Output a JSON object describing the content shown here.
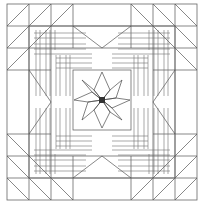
{
  "figure": {
    "kind": "line-diagram",
    "background_color": "#ffffff",
    "line_color": "#555555",
    "canvas": {
      "width": 204,
      "height": 205
    }
  },
  "geometry": {
    "frame": {
      "x": 7,
      "y": 4,
      "width": 190,
      "height": 196
    },
    "border_band": 22,
    "inner_band": 22,
    "center_block": {
      "x": 73,
      "y": 70,
      "width": 58,
      "height": 60
    },
    "star_center": {
      "x": 102,
      "y": 100
    },
    "star_points": 8,
    "star_outer_radius": 30,
    "star_inner_radius": 11
  },
  "elements": {
    "outer_frame": "outer-rectangle-frame",
    "sawtooth_border": "half-square-triangle-border",
    "inner_triangle_band": "flying-geese-band",
    "corner_plaid": "woven-strip-corner-block",
    "center_star": "eight-point-lemoyne-star",
    "center_dot": "star-center-square"
  },
  "labels": {
    "outer_border": "Sawtooth Border",
    "inner_border": "Flying Geese Band",
    "corner_block": "Plaid Corner Strips",
    "center": "LeMoyne Star"
  }
}
